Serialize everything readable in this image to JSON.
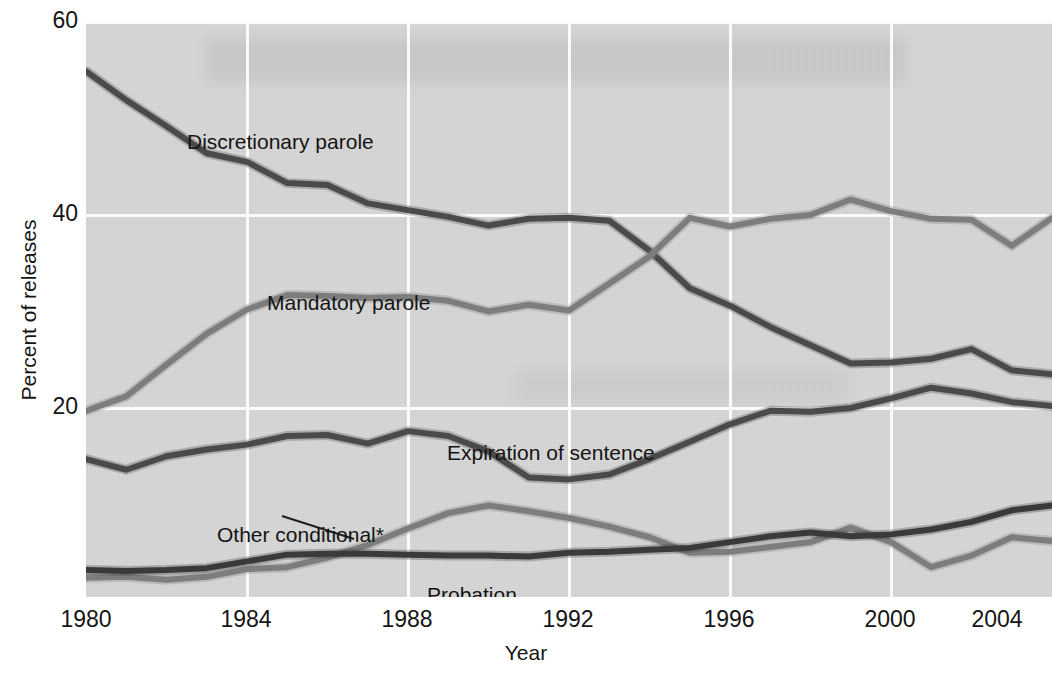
{
  "chart_data": {
    "type": "line",
    "title": "",
    "xlabel": "Year",
    "ylabel": "Percent of releases",
    "xlim": [
      1980,
      2004
    ],
    "ylim": [
      0,
      60
    ],
    "yticks": [
      20,
      40,
      60
    ],
    "xticks": [
      1980,
      1984,
      1988,
      1992,
      1996,
      2000,
      2004
    ],
    "grid": true,
    "legend": "inline-labels",
    "footnote_marker": "*",
    "x": [
      1980,
      1981,
      1982,
      1983,
      1984,
      1985,
      1986,
      1987,
      1988,
      1989,
      1990,
      1991,
      1992,
      1993,
      1994,
      1995,
      1996,
      1997,
      1998,
      1999,
      2000,
      2001,
      2002,
      2003,
      2004
    ],
    "series": [
      {
        "name": "Discretionary parole",
        "color": "#4a4a4a",
        "values": [
          54.8,
          51.8,
          49.1,
          46.3,
          45.4,
          43.2,
          43.0,
          41.1,
          40.4,
          39.7,
          38.8,
          39.5,
          39.6,
          39.3,
          36.2,
          32.3,
          30.5,
          28.3,
          26.4,
          24.5,
          24.6,
          25.0,
          26.0,
          23.8,
          23.4
        ]
      },
      {
        "name": "Mandatory parole",
        "color": "#7d7d7d",
        "values": [
          19.6,
          21.1,
          24.4,
          27.6,
          30.1,
          31.6,
          31.5,
          31.3,
          31.4,
          31.0,
          29.9,
          30.6,
          30.0,
          32.8,
          35.6,
          39.6,
          38.7,
          39.5,
          39.9,
          41.5,
          40.3,
          39.5,
          39.4,
          36.7,
          39.6
        ]
      },
      {
        "name": "Expiration of sentence",
        "color": "#4a4a4a",
        "values": [
          14.6,
          13.5,
          14.9,
          15.6,
          16.1,
          17.0,
          17.1,
          16.2,
          17.5,
          17.0,
          15.4,
          12.7,
          12.5,
          13.0,
          14.6,
          16.4,
          18.2,
          19.6,
          19.5,
          19.9,
          20.9,
          22.0,
          21.4,
          20.5,
          20.1
        ]
      },
      {
        "name": "Other conditional",
        "color": "#7d7d7d",
        "values": [
          2.3,
          2.4,
          2.1,
          2.4,
          3.2,
          3.4,
          4.4,
          5.7,
          7.4,
          9.0,
          9.8,
          9.2,
          8.5,
          7.6,
          6.5,
          4.9,
          5.0,
          5.5,
          6.0,
          7.5,
          6.0,
          3.4,
          4.6,
          6.5,
          6.1
        ]
      },
      {
        "name": "Probation",
        "color": "#3a3a3a",
        "values": [
          3.1,
          3.0,
          3.1,
          3.3,
          4.0,
          4.7,
          4.8,
          4.8,
          4.7,
          4.6,
          4.6,
          4.5,
          4.9,
          5.0,
          5.2,
          5.4,
          6.0,
          6.6,
          7.0,
          6.6,
          6.8,
          7.3,
          8.1,
          9.3,
          9.8
        ]
      }
    ]
  },
  "axes": {
    "y_label": "Percent of releases",
    "x_label": "Year",
    "y_ticks": [
      "20",
      "40",
      "60"
    ],
    "x_ticks": [
      "1980",
      "1984",
      "1988",
      "1992",
      "1996",
      "2000",
      "2004"
    ]
  },
  "series_labels": {
    "discretionary": "Discretionary parole",
    "mandatory": "Mandatory parole",
    "expiration": "Expiration of sentence",
    "other_conditional": "Other conditional*",
    "probation": "Probation"
  },
  "colors": {
    "plot_background": "#d2d2d2",
    "gridline": "#fbfbfb",
    "dark_line": "#4a4a4a",
    "light_line": "#7d7d7d",
    "text": "#151515"
  }
}
